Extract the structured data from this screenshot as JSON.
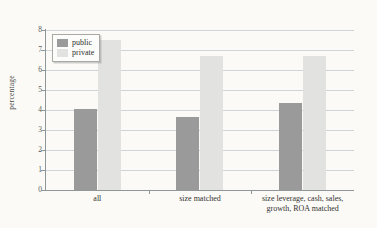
{
  "chart_data": {
    "type": "bar",
    "title": "",
    "xlabel": "",
    "ylabel": "percentage",
    "ylim": [
      0,
      8
    ],
    "yticks": [
      0,
      1,
      2,
      3,
      4,
      5,
      6,
      7,
      8
    ],
    "grid": true,
    "legend_position": "top-left inside plot",
    "categories": [
      "all",
      "size matched",
      "size leverage, cash, sales, growth, ROA matched"
    ],
    "category_lines": [
      [
        "all"
      ],
      [
        "size matched"
      ],
      [
        "size leverage, cash, sales,",
        "growth, ROA matched"
      ]
    ],
    "series": [
      {
        "name": "public",
        "color": "#9a9a9a",
        "values": [
          4.05,
          3.65,
          4.35
        ]
      },
      {
        "name": "private",
        "color": "#e2e2e0",
        "values": [
          7.5,
          6.7,
          6.7
        ]
      }
    ]
  },
  "legend": {
    "items": [
      {
        "label": "public",
        "swatch": "public-swatch"
      },
      {
        "label": "private",
        "swatch": "private-swatch"
      }
    ]
  },
  "axis": {
    "y_title": "percentage",
    "y_tick_labels": [
      "8",
      "7",
      "6",
      "5",
      "4",
      "3",
      "2",
      "1",
      "0"
    ]
  },
  "colors": {
    "public": "#9a9a9a",
    "private": "#e2e2e0",
    "grid": "#cfd6d8",
    "axis": "#8e9698",
    "paper": "#fbfaf7"
  }
}
